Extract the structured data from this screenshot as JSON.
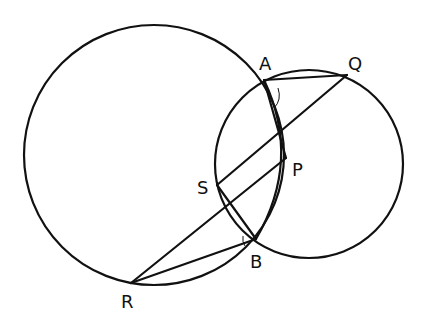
{
  "diagram": {
    "type": "geometry-two-intersecting-circles",
    "stroke_color": "#111111",
    "background": "#ffffff",
    "points": {
      "A": {
        "label": "A",
        "x": 264,
        "y": 80,
        "lx": 259,
        "ly": 70
      },
      "Q": {
        "label": "Q",
        "x": 347,
        "y": 75,
        "lx": 348,
        "ly": 70
      },
      "P": {
        "label": "P",
        "x": 286,
        "y": 158,
        "lx": 292,
        "ly": 176
      },
      "S": {
        "label": "S",
        "x": 217,
        "y": 185,
        "lx": 197,
        "ly": 194
      },
      "B": {
        "label": "B",
        "x": 256,
        "y": 239,
        "lx": 250,
        "ly": 268
      },
      "R": {
        "label": "R",
        "x": 131,
        "y": 283,
        "lx": 121,
        "ly": 308
      }
    },
    "circles": [
      {
        "name": "large-circle",
        "cx": 154,
        "cy": 155,
        "r": 130
      },
      {
        "name": "small-circle",
        "cx": 309,
        "cy": 164,
        "r": 94
      }
    ],
    "segments": [
      [
        "A",
        "Q"
      ],
      [
        "Q",
        "S"
      ],
      [
        "S",
        "B"
      ],
      [
        "B",
        "R"
      ],
      [
        "R",
        "P"
      ],
      [
        "A",
        "P"
      ]
    ],
    "arcs": [
      {
        "name": "arc-A-B-inner",
        "note": "arc of large circle through A to B drawn inside small circle"
      }
    ],
    "angle_marks": [
      "A",
      "B"
    ]
  }
}
